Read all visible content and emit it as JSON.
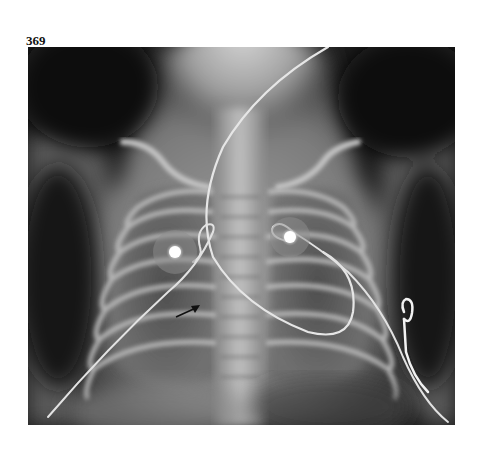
{
  "page": {
    "figure_number": "369"
  },
  "figure": {
    "type": "radiograph",
    "annotations": [
      {
        "kind": "arrow",
        "pointing": "right-up",
        "position": "right lower hemithorax near mediastinum"
      }
    ],
    "visible_devices": [
      {
        "name": "ecg-electrode",
        "position": "right upper chest"
      },
      {
        "name": "ecg-electrode",
        "position": "left upper chest"
      },
      {
        "name": "ecg-lead-wire",
        "position": "looping across chest"
      },
      {
        "name": "catheter",
        "position": "descending from neck across mediastinum"
      },
      {
        "name": "lead-clip",
        "position": "left lateral chest wall"
      }
    ],
    "colors": {
      "background": "#1b1b1b",
      "bone": "#cfcfcf",
      "soft_tissue": "#8a8a8a",
      "lung": "#4a4a4a",
      "page": "#ffffff"
    }
  }
}
